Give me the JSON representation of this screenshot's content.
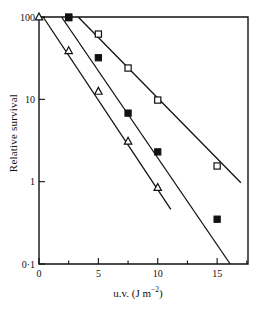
{
  "figure": {
    "title": "",
    "background": "#ffffff",
    "ink_color": "#111111"
  },
  "axes": {
    "x": {
      "label_prefix": "u.v. (J m",
      "label_exponent": "−2",
      "label_suffix": ")",
      "label_full": "u.v. (J m−2)",
      "scale": "linear",
      "min": 0,
      "max": 17.6,
      "major_ticks": [
        0,
        5,
        10,
        15
      ],
      "major_tick_labels": [
        "0",
        "5",
        "10",
        "15"
      ],
      "minor_ticks": [
        2.5,
        7.5,
        12.5,
        17.5
      ]
    },
    "y": {
      "label": "Relative survival",
      "scale": "log",
      "min": 0.1,
      "max": 100,
      "major_ticks": [
        100,
        10,
        1,
        0.1
      ],
      "major_tick_labels": [
        "100",
        "10",
        "1",
        "0·1"
      ]
    }
  },
  "chart_data": {
    "type": "scatter",
    "title": "",
    "xlabel": "u.v. (J m−2)",
    "ylabel": "Relative survival",
    "xlim": [
      0,
      17.6
    ],
    "ylim": [
      0.1,
      100
    ],
    "yscale": "log",
    "xscale": "linear",
    "grid": false,
    "legend": "none",
    "series": [
      {
        "name": "resistant",
        "marker": "open-square",
        "points": [
          {
            "x": 2.5,
            "y": 100
          },
          {
            "x": 5.0,
            "y": 62
          },
          {
            "x": 7.5,
            "y": 24
          },
          {
            "x": 10.0,
            "y": 9.8
          },
          {
            "x": 15.0,
            "y": 1.55
          }
        ],
        "fit_line": {
          "x_start": 3.3,
          "y_start": 100,
          "x_end": 17.0,
          "y_end": 0.97
        }
      },
      {
        "name": "intermediate",
        "marker": "filled-square",
        "points": [
          {
            "x": 2.5,
            "y": 98
          },
          {
            "x": 5.0,
            "y": 32
          },
          {
            "x": 7.5,
            "y": 6.8
          },
          {
            "x": 10.0,
            "y": 2.3
          },
          {
            "x": 15.0,
            "y": 0.35
          }
        ],
        "fit_line": {
          "x_start": 1.9,
          "y_start": 100,
          "x_end": 16.1,
          "y_end": 0.1
        }
      },
      {
        "name": "sensitive",
        "marker": "open-triangle",
        "points": [
          {
            "x": 0.0,
            "y": 100
          },
          {
            "x": 2.5,
            "y": 39
          },
          {
            "x": 5.0,
            "y": 12.5
          },
          {
            "x": 7.5,
            "y": 3.1
          },
          {
            "x": 10.0,
            "y": 0.85
          }
        ],
        "fit_line": {
          "x_start": 0.35,
          "y_start": 100,
          "x_end": 11.1,
          "y_end": 0.46
        }
      }
    ]
  }
}
